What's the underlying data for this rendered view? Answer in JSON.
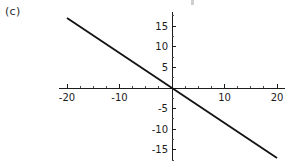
{
  "panel": {
    "label": "(c)"
  },
  "chart_data": {
    "type": "line",
    "title": "",
    "xlabel": "",
    "ylabel": "",
    "xlim": [
      -21.5,
      21.5
    ],
    "ylim": [
      -18.5,
      18.5
    ],
    "grid": false,
    "legend": null,
    "x_ticks": [
      -20,
      -10,
      10,
      20
    ],
    "x_tick_labels": [
      "-20",
      "-10",
      "10",
      "20"
    ],
    "y_ticks": [
      15,
      10,
      5,
      -5,
      -10,
      -15
    ],
    "y_tick_labels": [
      "15",
      "10",
      "5",
      "-5",
      "-10",
      "-15"
    ],
    "x_minor_tick_step": 2.5,
    "y_minor_tick_step": 2.5,
    "series": [
      {
        "name": "line",
        "slope": -0.85,
        "intercept": 0,
        "x": [
          -20,
          20
        ],
        "values": [
          17,
          -17
        ],
        "color": "#111111"
      }
    ]
  },
  "colors": {
    "background": "#ffffff",
    "axis": "#1c1c1c",
    "line": "#111111",
    "text": "#1c1c1c"
  }
}
